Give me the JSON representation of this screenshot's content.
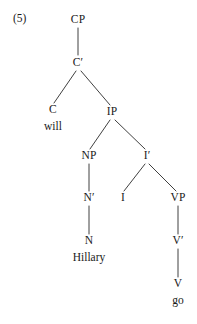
{
  "figure": {
    "example_number": "(5)",
    "sentence": "Hillary will go",
    "ink_color": "#1a1a1a",
    "edge_color": "#2a2a2a",
    "background_color": "#ffffff"
  },
  "tree": {
    "nodes": [
      {
        "id": "CP",
        "label": "CP",
        "x": 78,
        "y": 20,
        "kind": "phrase"
      },
      {
        "id": "Cbar",
        "label": "C′",
        "x": 78,
        "y": 63,
        "kind": "bar"
      },
      {
        "id": "C",
        "label": "C",
        "x": 53,
        "y": 110,
        "kind": "head"
      },
      {
        "id": "IP",
        "label": "IP",
        "x": 112,
        "y": 112,
        "kind": "phrase"
      },
      {
        "id": "NP",
        "label": "NP",
        "x": 89,
        "y": 156,
        "kind": "phrase"
      },
      {
        "id": "Ibar",
        "label": "I′",
        "x": 147,
        "y": 156,
        "kind": "bar"
      },
      {
        "id": "Nbar",
        "label": "N′",
        "x": 89,
        "y": 198,
        "kind": "bar"
      },
      {
        "id": "I",
        "label": "I",
        "x": 123,
        "y": 198,
        "kind": "head"
      },
      {
        "id": "VP",
        "label": "VP",
        "x": 178,
        "y": 198,
        "kind": "phrase"
      },
      {
        "id": "N",
        "label": "N",
        "x": 89,
        "y": 241,
        "kind": "head"
      },
      {
        "id": "Vbar",
        "label": "V′",
        "x": 178,
        "y": 241,
        "kind": "bar"
      },
      {
        "id": "V",
        "label": "V",
        "x": 178,
        "y": 284,
        "kind": "head"
      }
    ],
    "terminals": [
      {
        "id": "will",
        "label": "will",
        "x": 53,
        "y": 127,
        "parent": "C"
      },
      {
        "id": "Hillary",
        "label": "Hillary",
        "x": 89,
        "y": 258,
        "parent": "N"
      },
      {
        "id": "go",
        "label": "go",
        "x": 178,
        "y": 301,
        "parent": "V"
      }
    ],
    "edges": [
      {
        "from": "CP",
        "to": "Cbar",
        "x1": 78,
        "y1": 28,
        "x2": 78,
        "y2": 55
      },
      {
        "from": "Cbar",
        "to": "C",
        "x1": 76,
        "y1": 71,
        "x2": 54,
        "y2": 103
      },
      {
        "from": "Cbar",
        "to": "IP",
        "x1": 81,
        "y1": 71,
        "x2": 110,
        "y2": 105
      },
      {
        "from": "IP",
        "to": "NP",
        "x1": 110,
        "y1": 120,
        "x2": 90,
        "y2": 149
      },
      {
        "from": "IP",
        "to": "Ibar",
        "x1": 115,
        "y1": 120,
        "x2": 145,
        "y2": 149
      },
      {
        "from": "NP",
        "to": "Nbar",
        "x1": 89,
        "y1": 164,
        "x2": 89,
        "y2": 191
      },
      {
        "from": "Ibar",
        "to": "I",
        "x1": 145,
        "y1": 164,
        "x2": 124,
        "y2": 191
      },
      {
        "from": "Ibar",
        "to": "VP",
        "x1": 149,
        "y1": 164,
        "x2": 176,
        "y2": 191
      },
      {
        "from": "Nbar",
        "to": "N",
        "x1": 89,
        "y1": 206,
        "x2": 89,
        "y2": 234
      },
      {
        "from": "VP",
        "to": "Vbar",
        "x1": 178,
        "y1": 206,
        "x2": 178,
        "y2": 234
      },
      {
        "from": "Vbar",
        "to": "V",
        "x1": 178,
        "y1": 249,
        "x2": 178,
        "y2": 277
      }
    ]
  }
}
